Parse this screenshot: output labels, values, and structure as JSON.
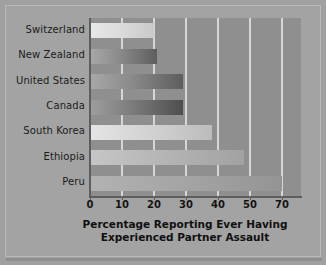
{
  "chart_data": {
    "type": "bar",
    "orientation": "horizontal",
    "title": "",
    "xlabel_line1": "Percentage Reporting Ever Having",
    "xlabel_line2": "Experienced Partner Assault",
    "ylabel": "",
    "categories": [
      "Switzerland",
      "New Zealand",
      "United States",
      "Canada",
      "South Korea",
      "Ethiopia",
      "Peru"
    ],
    "values": [
      20,
      21,
      29,
      29,
      38,
      48,
      70
    ],
    "tick_labels": [
      "0",
      "10",
      "20",
      "30",
      "40",
      "50",
      "70"
    ],
    "tick_values": [
      0,
      10,
      20,
      30,
      40,
      50,
      70
    ],
    "xlim": [
      0,
      76
    ],
    "grid": true,
    "grid_axis": "x",
    "legend": "none",
    "note": "x-axis tick labels jump from 50 to 70 at evenly spaced positions"
  },
  "style": {
    "figure_background": "#a3a3a3",
    "plot_background": "#8f8f8f",
    "gridline_color": "#d6d6d6",
    "axis_color": "#5e5e5e",
    "text_color": "#141414"
  },
  "bars": [
    {
      "category": "Switzerland",
      "value": 20,
      "shade": "bar-light"
    },
    {
      "category": "New Zealand",
      "value": 21,
      "shade": "bar-dark"
    },
    {
      "category": "United States",
      "value": 29,
      "shade": "bar-dark"
    },
    {
      "category": "Canada",
      "value": 29,
      "shade": "bar-verydark"
    },
    {
      "category": "South Korea",
      "value": 38,
      "shade": "bar-pale"
    },
    {
      "category": "Ethiopia",
      "value": 48,
      "shade": "bar-medlight"
    },
    {
      "category": "Peru",
      "value": 70,
      "shade": "bar-medium"
    }
  ]
}
